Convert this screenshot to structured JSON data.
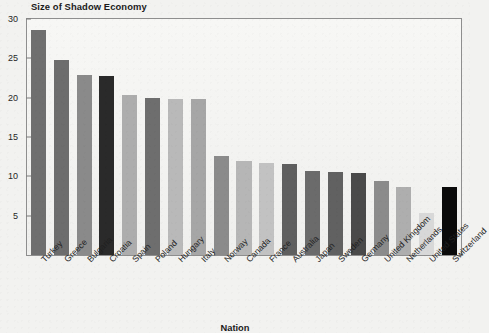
{
  "chart_data": {
    "type": "bar",
    "title": "Size of Shadow Economy",
    "xlabel": "Nation",
    "ylabel": "",
    "ylim": [
      0,
      30
    ],
    "yticks": [
      30,
      25,
      20,
      15,
      10,
      5
    ],
    "grid": false,
    "legend": "none",
    "categories": [
      "Turkey",
      "Greece",
      "Bulgaria",
      "Croatia",
      "Spain",
      "Poland",
      "Hungary",
      "Italy",
      "Norway",
      "Canada",
      "France",
      "Australia",
      "Japan",
      "Sweden",
      "Germany",
      "United Kingdom",
      "Netherlands",
      "United States",
      "Switzerland"
    ],
    "values": [
      28.6,
      24.8,
      22.9,
      22.7,
      20.3,
      19.9,
      19.8,
      19.8,
      12.6,
      12.0,
      11.7,
      11.6,
      10.7,
      10.6,
      10.4,
      9.4,
      8.6,
      5.4,
      8.6
    ],
    "bar_colors": [
      "#6f6f6f",
      "#6d6d6d",
      "#8a8a8a",
      "#2a2a2a",
      "#adadad",
      "#6e6e6e",
      "#b9b9b9",
      "#a6a6a6",
      "#8b8b8b",
      "#b6b6b6",
      "#c2c2c2",
      "#5f5f5f",
      "#6b6b6b",
      "#616161",
      "#4a4a4a",
      "#8b8b8b",
      "#aeaeae",
      "#d8d8d8",
      "#0a0a0a"
    ],
    "frame_color": "#8e8e8e",
    "background": "#f2f2f0"
  }
}
